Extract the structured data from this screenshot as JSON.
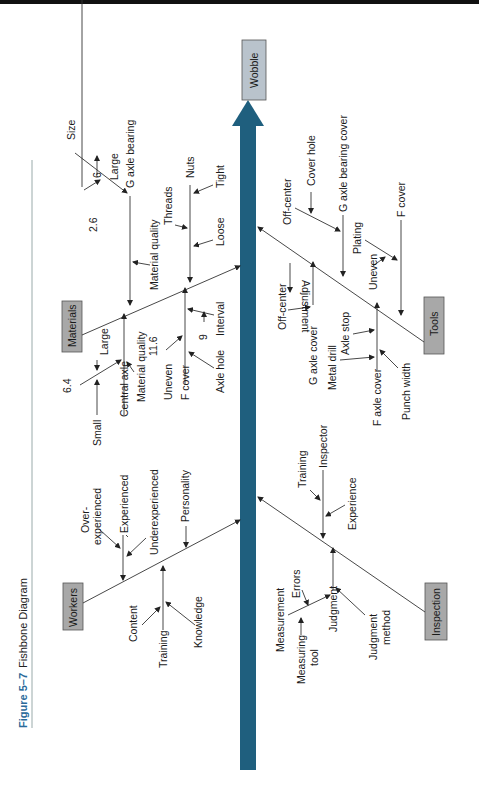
{
  "figure": {
    "number": "Figure 5–7",
    "title": "Fishbone Diagram"
  },
  "effect": {
    "label": "Wobble"
  },
  "colors": {
    "spine": "#1f5f7e",
    "effect_box": "#b9c3cc",
    "category_box": "#a8a8a8",
    "caption_accent": "#2a6a9a"
  },
  "categories": {
    "materials": {
      "label": "Materials",
      "causes": {
        "g_axle_bearing": "G axle bearing",
        "size": "Size",
        "six": "6",
        "large_top": "Large",
        "two_six": "2.6",
        "material_quality_top": "Material quality",
        "nuts": "Nuts",
        "threads": "Threads",
        "tight": "Tight",
        "loose": "Loose",
        "central_axle": "Central axle",
        "large": "Large",
        "six_four": "6.4",
        "small": "Small",
        "material_quality": "Material quality",
        "f_cover": "F cover",
        "eleven_six": "11.6",
        "uneven": "Uneven",
        "interval": "Interval",
        "nine": "9",
        "axle_hole": "Axle hole"
      }
    },
    "tools": {
      "label": "Tools",
      "causes": {
        "adjustment": "Adjustment",
        "g_axle_bearing_cover": "G axle bearing cover",
        "cover_hole": "Cover hole",
        "off_center_top": "Off-center",
        "f_cover": "F cover",
        "plating": "Plating",
        "uneven": "Uneven",
        "g_axle_cover": "G axle cover",
        "off_center": "Off-center",
        "f_axle_cover": "F axle cover",
        "axle_stop": "Axle stop",
        "metal_drill": "Metal drill",
        "punch_width": "Punch width"
      }
    },
    "workers": {
      "label": "Workers",
      "causes": {
        "experienced": "Experienced",
        "over_experienced_1": "Over-",
        "over_experienced_2": "experienced",
        "underexperienced": "Underexperienced",
        "personality": "Personality",
        "training": "Training",
        "content": "Content",
        "knowledge": "Knowledge"
      }
    },
    "inspection": {
      "label": "Inspection",
      "causes": {
        "inspector": "Inspector",
        "training": "Training",
        "experience": "Experience",
        "judgment": "Judgment",
        "judgment_method_1": "Judgment",
        "judgment_method_2": "method",
        "measurement": "Measurement",
        "errors": "Errors",
        "measuring_tool_1": "Measuring",
        "measuring_tool_2": "tool"
      }
    }
  }
}
